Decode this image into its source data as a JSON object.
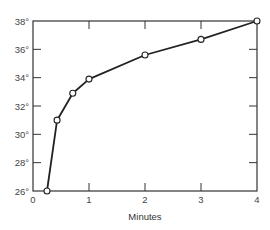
{
  "chart_data": {
    "type": "line",
    "title": "",
    "xlabel": "Minutes",
    "ylabel": "",
    "xlim": [
      0,
      4
    ],
    "ylim": [
      26,
      38
    ],
    "x_ticks": [
      0,
      1,
      2,
      3,
      4
    ],
    "x_tick_labels": [
      "0",
      "1",
      "2",
      "3",
      "4"
    ],
    "y_ticks": [
      26,
      28,
      30,
      32,
      34,
      36,
      38
    ],
    "y_tick_labels": [
      "26°",
      "28°",
      "30°",
      "32°",
      "34°",
      "36°",
      "38°"
    ],
    "grid": false,
    "frame": "box",
    "legend": null,
    "series": [
      {
        "name": "Temperature",
        "marker": "open-circle",
        "color": "#222222",
        "x": [
          0.25,
          0.43,
          0.71,
          1.0,
          2.0,
          3.0,
          4.0
        ],
        "values": [
          26.0,
          31.0,
          32.9,
          33.9,
          35.6,
          36.7,
          38.0
        ]
      }
    ]
  },
  "colors": {
    "line": "#222222",
    "axis": "#333333",
    "marker_fill": "#ffffff",
    "background": "#ffffff"
  }
}
